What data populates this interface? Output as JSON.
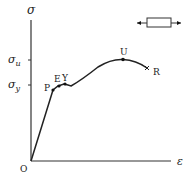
{
  "diagram": {
    "type": "stress-strain-curve",
    "axes": {
      "y_label": "σ",
      "x_label": "ε",
      "origin_label": "O"
    },
    "ticks": {
      "ultimate": "σ",
      "ultimate_sub": "u",
      "yield": "σ",
      "yield_sub": "y"
    },
    "points": {
      "proportional_limit": "P",
      "elastic_limit": "E",
      "yield_point": "Y",
      "ultimate_point": "U",
      "rupture_point": "R"
    },
    "specimen_icon": "tensile-specimen-icon"
  }
}
